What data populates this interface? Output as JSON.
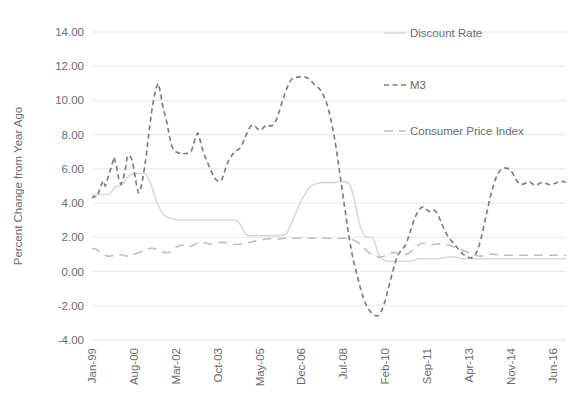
{
  "chart_data": {
    "type": "line",
    "title": "",
    "xlabel": "",
    "ylabel": "Percent Change from Year Ago",
    "ylim": [
      -4.0,
      14.0
    ],
    "yticks": [
      "-4.00",
      "-2.00",
      "0.00",
      "2.00",
      "4.00",
      "6.00",
      "8.00",
      "10.00",
      "12.00",
      "14.00"
    ],
    "ytick_values": [
      -4,
      -2,
      0,
      2,
      4,
      6,
      8,
      10,
      12,
      14
    ],
    "grid": true,
    "legend_position": "right",
    "xtick_labels": [
      "Jan-99",
      "Aug-00",
      "Mar-02",
      "Oct-03",
      "May-05",
      "Dec-06",
      "Jul-08",
      "Feb-10",
      "Sep-11",
      "Apr-13",
      "Nov-14",
      "Jun-16"
    ],
    "xtick_indices": [
      0,
      19,
      38,
      57,
      76,
      95,
      114,
      133,
      152,
      171,
      190,
      209
    ],
    "x_count": 216,
    "series": [
      {
        "name": "Discount Rate",
        "style": "solid",
        "color": "#d9d9d9",
        "values": [
          4.5,
          4.5,
          4.5,
          4.5,
          4.5,
          4.5,
          4.5,
          4.5,
          4.52,
          4.7,
          4.88,
          5.0,
          5.0,
          5.0,
          5.1,
          5.3,
          5.5,
          5.6,
          5.7,
          5.73,
          5.73,
          5.73,
          5.73,
          5.73,
          5.73,
          5.6,
          5.35,
          5.0,
          4.6,
          4.2,
          3.9,
          3.6,
          3.4,
          3.28,
          3.2,
          3.15,
          3.1,
          3.05,
          3.0,
          3.0,
          3.0,
          3.0,
          3.0,
          3.0,
          3.0,
          3.0,
          3.0,
          3.0,
          3.0,
          3.0,
          3.0,
          3.0,
          3.0,
          3.0,
          3.0,
          3.0,
          3.0,
          3.0,
          3.0,
          3.0,
          3.0,
          3.0,
          3.0,
          3.0,
          3.0,
          3.0,
          2.95,
          2.8,
          2.6,
          2.35,
          2.15,
          2.1,
          2.1,
          2.1,
          2.1,
          2.1,
          2.1,
          2.1,
          2.1,
          2.1,
          2.1,
          2.1,
          2.1,
          2.1,
          2.1,
          2.1,
          2.1,
          2.12,
          2.2,
          2.4,
          2.7,
          3.0,
          3.3,
          3.6,
          3.9,
          4.15,
          4.4,
          4.6,
          4.8,
          4.95,
          5.05,
          5.1,
          5.15,
          5.18,
          5.2,
          5.2,
          5.2,
          5.2,
          5.2,
          5.2,
          5.2,
          5.2,
          5.22,
          5.25,
          5.25,
          5.25,
          5.2,
          5.1,
          4.7,
          4.2,
          3.6,
          3.0,
          2.5,
          2.2,
          2.05,
          2.0,
          2.0,
          2.0,
          1.8,
          1.4,
          1.0,
          0.8,
          0.7,
          0.65,
          0.62,
          0.6,
          0.6,
          0.6,
          0.6,
          0.6,
          0.6,
          0.6,
          0.6,
          0.6,
          0.6,
          0.62,
          0.65,
          0.7,
          0.75,
          0.75,
          0.75,
          0.75,
          0.75,
          0.75,
          0.75,
          0.75,
          0.75,
          0.75,
          0.78,
          0.8,
          0.82,
          0.85,
          0.85,
          0.85,
          0.85,
          0.85,
          0.82,
          0.78,
          0.75,
          0.75,
          0.75,
          0.75,
          0.75,
          0.75,
          0.75,
          0.75,
          0.75,
          0.75,
          0.75,
          0.75,
          0.75,
          0.75,
          0.75,
          0.75,
          0.75,
          0.75,
          0.75,
          0.75,
          0.75,
          0.75,
          0.75,
          0.75,
          0.75,
          0.75,
          0.75,
          0.75,
          0.75,
          0.75,
          0.75,
          0.75,
          0.75,
          0.75,
          0.75,
          0.75,
          0.75,
          0.75,
          0.75,
          0.75,
          0.75,
          0.75,
          0.75,
          0.75,
          0.75,
          0.75,
          0.75,
          0.75
        ]
      },
      {
        "name": "M3",
        "style": "dashed",
        "color": "#7f7f7f",
        "values": [
          4.3,
          4.4,
          4.35,
          4.6,
          5.0,
          5.3,
          5.0,
          5.4,
          5.8,
          6.2,
          6.7,
          6.2,
          5.5,
          5.1,
          5.3,
          5.9,
          6.7,
          6.8,
          6.6,
          6.0,
          5.2,
          4.6,
          4.8,
          5.4,
          6.2,
          7.2,
          8.3,
          9.3,
          10.1,
          10.7,
          11.0,
          10.5,
          9.7,
          9.2,
          8.7,
          8.0,
          7.4,
          7.1,
          7.0,
          6.95,
          6.9,
          6.85,
          6.9,
          6.9,
          6.95,
          7.0,
          7.4,
          7.9,
          8.1,
          7.7,
          7.2,
          6.8,
          6.5,
          6.2,
          5.9,
          5.6,
          5.4,
          5.3,
          5.25,
          5.4,
          5.8,
          6.2,
          6.5,
          6.7,
          6.9,
          7.05,
          7.1,
          7.2,
          7.4,
          7.7,
          8.0,
          8.3,
          8.5,
          8.55,
          8.5,
          8.35,
          8.25,
          8.3,
          8.45,
          8.55,
          8.55,
          8.5,
          8.55,
          8.7,
          9.0,
          9.4,
          9.8,
          10.2,
          10.6,
          10.9,
          11.15,
          11.3,
          11.35,
          11.35,
          11.38,
          11.4,
          11.4,
          11.35,
          11.3,
          11.2,
          11.05,
          10.9,
          10.8,
          10.7,
          10.55,
          10.3,
          10.0,
          9.6,
          9.1,
          8.5,
          7.8,
          7.0,
          6.1,
          5.2,
          4.3,
          3.4,
          2.5,
          1.7,
          1.0,
          0.4,
          -0.1,
          -0.6,
          -1.1,
          -1.5,
          -1.85,
          -2.1,
          -2.3,
          -2.45,
          -2.55,
          -2.6,
          -2.55,
          -2.4,
          -2.1,
          -1.7,
          -1.2,
          -0.7,
          -0.2,
          0.3,
          0.7,
          1.0,
          1.2,
          1.35,
          1.5,
          1.8,
          2.2,
          2.6,
          3.0,
          3.3,
          3.55,
          3.7,
          3.78,
          3.72,
          3.6,
          3.5,
          3.55,
          3.6,
          3.5,
          3.3,
          3.0,
          2.7,
          2.4,
          2.15,
          1.95,
          1.8,
          1.65,
          1.5,
          1.35,
          1.2,
          1.05,
          0.95,
          0.88,
          0.82,
          0.8,
          0.85,
          1.0,
          1.3,
          1.7,
          2.2,
          2.8,
          3.4,
          4.0,
          4.55,
          5.0,
          5.4,
          5.7,
          5.9,
          6.0,
          6.05,
          6.05,
          6.0,
          5.9,
          5.7,
          5.45,
          5.25,
          5.15,
          5.1,
          5.12,
          5.2,
          5.25,
          5.2,
          5.1,
          5.05,
          5.08,
          5.15,
          5.2,
          5.2,
          5.15,
          5.1,
          5.08,
          5.1,
          5.15,
          5.2,
          5.25,
          5.28,
          5.25,
          5.22
        ]
      },
      {
        "name": "Consumer Price Index",
        "style": "longdash",
        "color": "#bfbfbf",
        "values": [
          1.3,
          1.35,
          1.3,
          1.2,
          1.1,
          1.0,
          0.95,
          0.9,
          0.9,
          0.92,
          0.95,
          1.0,
          1.0,
          0.98,
          0.95,
          0.92,
          0.9,
          0.92,
          0.95,
          1.0,
          1.05,
          1.1,
          1.15,
          1.2,
          1.25,
          1.3,
          1.35,
          1.38,
          1.35,
          1.3,
          1.25,
          1.2,
          1.15,
          1.12,
          1.1,
          1.12,
          1.2,
          1.3,
          1.4,
          1.48,
          1.52,
          1.55,
          1.52,
          1.48,
          1.45,
          1.48,
          1.55,
          1.62,
          1.7,
          1.72,
          1.7,
          1.68,
          1.65,
          1.62,
          1.6,
          1.62,
          1.65,
          1.68,
          1.7,
          1.72,
          1.7,
          1.68,
          1.65,
          1.62,
          1.6,
          1.58,
          1.58,
          1.6,
          1.62,
          1.65,
          1.68,
          1.7,
          1.72,
          1.75,
          1.78,
          1.8,
          1.82,
          1.85,
          1.88,
          1.9,
          1.92,
          1.92,
          1.9,
          1.9,
          1.9,
          1.9,
          1.92,
          1.95,
          1.95,
          1.95,
          1.95,
          1.95,
          1.95,
          1.95,
          1.95,
          1.95,
          1.95,
          1.95,
          1.95,
          1.95,
          1.95,
          1.95,
          1.95,
          1.95,
          1.95,
          1.95,
          1.95,
          1.95,
          1.95,
          1.95,
          1.95,
          1.95,
          1.95,
          1.95,
          1.95,
          1.95,
          1.95,
          1.92,
          1.88,
          1.82,
          1.75,
          1.65,
          1.55,
          1.42,
          1.3,
          1.18,
          1.08,
          1.0,
          0.92,
          0.88,
          0.85,
          0.85,
          0.88,
          0.92,
          0.98,
          1.05,
          1.1,
          1.12,
          1.1,
          1.08,
          1.05,
          1.02,
          1.0,
          1.02,
          1.1,
          1.2,
          1.32,
          1.45,
          1.55,
          1.62,
          1.65,
          1.65,
          1.62,
          1.6,
          1.58,
          1.58,
          1.6,
          1.62,
          1.62,
          1.6,
          1.58,
          1.55,
          1.52,
          1.48,
          1.45,
          1.4,
          1.35,
          1.3,
          1.25,
          1.2,
          1.15,
          1.1,
          1.05,
          1.0,
          0.95,
          0.92,
          0.9,
          0.9,
          0.92,
          0.95,
          1.0,
          1.02,
          1.02,
          1.0,
          0.98,
          0.95,
          0.95,
          0.95,
          0.95,
          0.95,
          0.95,
          0.95,
          0.95,
          0.95,
          0.95,
          0.95,
          0.95,
          0.95,
          0.95,
          0.95,
          0.95,
          0.95,
          0.95,
          0.95,
          0.95,
          0.95,
          0.95,
          0.95,
          0.95,
          0.95,
          0.95,
          0.95,
          0.95,
          0.95,
          0.95,
          0.95
        ]
      }
    ]
  },
  "axes": {
    "y_title": "Percent Change from Year Ago"
  },
  "legend": {
    "entries": [
      {
        "label": "Discount Rate"
      },
      {
        "label": "M3"
      },
      {
        "label": "Consumer Price Index"
      }
    ]
  },
  "colors": {
    "grid": "#e8e8ea",
    "text": "#6b6c6e",
    "discount_rate": "#d9d9d9",
    "m3": "#7f7f7f",
    "cpi": "#bfbfbf",
    "background": "#ffffff"
  }
}
